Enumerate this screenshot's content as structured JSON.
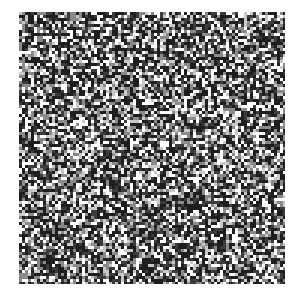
{
  "image": {
    "description": "Square noise / checker texture",
    "x": 19,
    "y": 12,
    "width": 266,
    "height": 272,
    "cell_size": 3,
    "seed": 1337,
    "palette": [
      "#1e1e1e",
      "#3c3c3c",
      "#8a8a8a",
      "#c8c8c8",
      "#ffffff"
    ],
    "weights": [
      0.34,
      0.16,
      0.18,
      0.12,
      0.2
    ]
  }
}
